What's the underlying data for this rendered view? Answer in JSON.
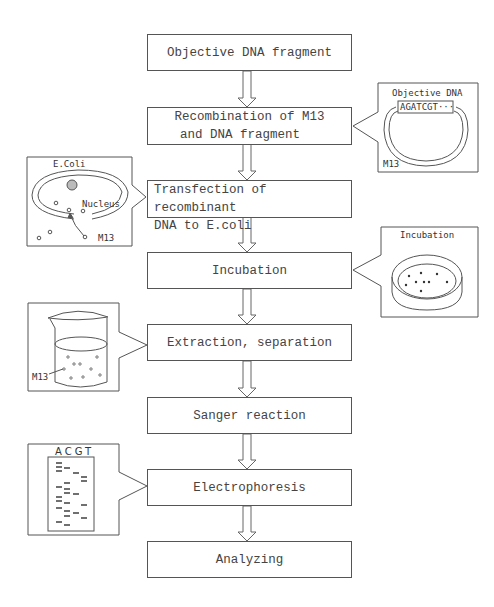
{
  "diagram": {
    "type": "flowchart",
    "direction": "top-to-bottom",
    "steps": [
      {
        "id": "s1",
        "label": "Objective DNA fragment"
      },
      {
        "id": "s2",
        "label_line1": "Recombination of M13",
        "label_line2": "and DNA fragment"
      },
      {
        "id": "s3",
        "label_line1": "Transfection of recombinant",
        "label_line2": "DNA to E.coli"
      },
      {
        "id": "s4",
        "label": "Incubation"
      },
      {
        "id": "s5",
        "label": "Extraction, separation"
      },
      {
        "id": "s6",
        "label": "Sanger reaction"
      },
      {
        "id": "s7",
        "label": "Electrophoresis"
      },
      {
        "id": "s8",
        "label": "Analyzing"
      }
    ],
    "callouts": {
      "recombination": {
        "title": "Objective DNA",
        "sequence": "AGATCGT···",
        "vector_label": "M13",
        "attached_to": "s2",
        "side": "right"
      },
      "transfection": {
        "title": "E.Coli",
        "nucleus_label": "Nucleus",
        "phage_label": "M13",
        "attached_to": "s3",
        "side": "left"
      },
      "incubation": {
        "title": "Incubation",
        "attached_to": "s4",
        "side": "right"
      },
      "extraction": {
        "phage_label": "M13",
        "attached_to": "s5",
        "side": "left"
      },
      "electrophoresis": {
        "lanes": "ACGT",
        "attached_to": "s7",
        "side": "left"
      }
    },
    "colors": {
      "line": "#555555",
      "background": "#ffffff",
      "text": "#444444"
    }
  }
}
